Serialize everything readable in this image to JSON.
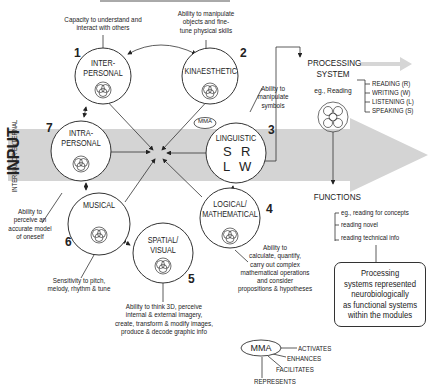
{
  "input": {
    "title": "INPUT",
    "subtitle": "INTERNAL OR EXTERNAL"
  },
  "modules": [
    {
      "number": "1",
      "label_line1": "INTER-",
      "label_line2": "PERSONAL",
      "description": [
        "Capacity to understand and",
        "interact with others"
      ]
    },
    {
      "number": "2",
      "label_line1": "KINAESTHETIC",
      "label_line2": "",
      "description": [
        "Ability to manipulate",
        "objects and fine-",
        "tune physical skills"
      ]
    },
    {
      "number": "3",
      "label_line1": "LINGUISTIC",
      "label_line2": "",
      "letters": [
        "S",
        "R",
        "L",
        "W"
      ],
      "description": [
        "Ability to",
        "manipulate",
        "symbols"
      ]
    },
    {
      "number": "4",
      "label_line1": "LOGICAL/",
      "label_line2": "MATHEMATICAL",
      "description": [
        "Ability to",
        "calculate, quantify,",
        "carry out complex",
        "mathematical operations",
        "and consider",
        "propositions & hypotheses"
      ]
    },
    {
      "number": "5",
      "label_line1": "SPATIAL/",
      "label_line2": "VISUAL",
      "description": [
        "Ability to think 3D, perceive",
        "internal & external imagery,",
        "create, transform & modify images,",
        "produce & decode graphic info"
      ]
    },
    {
      "number": "6",
      "label_line1": "MUSICAL",
      "label_line2": "",
      "description": [
        "Sensitivity to pitch,",
        "melody, rhythm & tune"
      ]
    },
    {
      "number": "7",
      "label_line1": "INTRA-",
      "label_line2": "PERSONAL",
      "description": [
        "Ability to",
        "perceive an",
        "accurate model",
        "of oneself"
      ]
    }
  ],
  "mma_tag": "MMA",
  "processing_system": {
    "title_line1": "PROCESSING",
    "title_line2": "SYSTEM",
    "example": "eg., Reading",
    "items": [
      "READING (R)",
      "WRITING (W)",
      "LISTENING (L)",
      "SPEAKING (S)"
    ]
  },
  "functions": {
    "title": "FUNCTIONS",
    "items": [
      "eg., reading for concepts",
      "reading novel",
      "reading technical info"
    ]
  },
  "note_box": [
    "Processing",
    "systems represented",
    "neurobiologically",
    "as functional systems",
    "within the modules"
  ],
  "legend": {
    "mma": "MMA",
    "items": [
      "ACTIVATES",
      "ENHANCES",
      "FACILITATES",
      "REPRESENTS"
    ]
  }
}
